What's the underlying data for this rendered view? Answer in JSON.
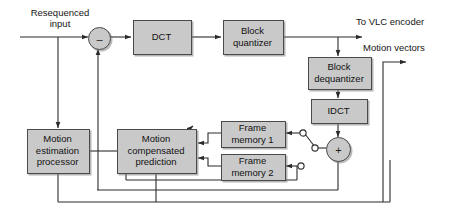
{
  "diagram": {
    "type": "block-diagram",
    "colors": {
      "box_fill": "#c9c9c9",
      "box_stroke": "#4a4a4a",
      "line": "#2b2b2b",
      "background": "#ffffff"
    },
    "labels": {
      "input": "Resequenced\ninput",
      "to_vlc": "To VLC encoder",
      "motion_vectors": "Motion vectors"
    },
    "blocks": [
      {
        "id": "dct",
        "label": "DCT"
      },
      {
        "id": "block-quantizer",
        "label": "Block\nquantizer"
      },
      {
        "id": "block-dequantizer",
        "label": "Block\ndequantizer"
      },
      {
        "id": "idct",
        "label": "IDCT"
      },
      {
        "id": "frame-memory-1",
        "label": "Frame\nmemory 1"
      },
      {
        "id": "frame-memory-2",
        "label": "Frame\nmemory 2"
      },
      {
        "id": "motion-compensated-prediction",
        "label": "Motion\ncompensated\nprediction"
      },
      {
        "id": "motion-estimation-processor",
        "label": "Motion\nestimation\nprocessor"
      }
    ],
    "operators": [
      {
        "id": "subtractor",
        "symbol": "–"
      },
      {
        "id": "adder",
        "symbol": "+"
      }
    ],
    "switch": {
      "id": "frame-memory-selector",
      "position": "frame-memory-1"
    }
  }
}
